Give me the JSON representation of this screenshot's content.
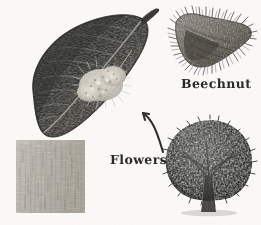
{
  "plate": {
    "kind": "botanical-illustration",
    "subject": "Beech (Fagus) plate",
    "background_color": "#fbfaf9",
    "width": 261,
    "height": 225,
    "style": "engraving / halftone monochrome"
  },
  "labels": {
    "beechnut": "Beechnut",
    "flowers": "Flowers"
  },
  "colors": {
    "background": "#fbfaf9",
    "ink_dark": "#2a2a28",
    "leaf_dark": "#3a3a38",
    "leaf_mid": "#55534f",
    "leaf_light": "#7d7b75",
    "flower_pale": "#e8e4da",
    "bark_light": "#cbc7bf",
    "bark_mid": "#a9a49b",
    "husk_mid": "#8d887e",
    "husk_dark": "#4a4743",
    "tree_canopy_dark": "#3f3f3d",
    "tree_canopy_mid": "#6a6a66",
    "trunk": "#4b4844"
  },
  "figures": [
    {
      "id": "leaf",
      "name": "beech-leaf-with-flowers",
      "caption_ref": "Flowers",
      "bbox": [
        22,
        8,
        150,
        140
      ],
      "description": "Large dark ovate beech leaf with pinnate parallel veins, pointed tip and twig at upper right, pale bristly flower catkin cluster on lower right of blade"
    },
    {
      "id": "bark",
      "name": "beech-bark-swatch",
      "bbox": [
        16,
        140,
        69,
        73
      ],
      "description": "Rectangular pale gray bark texture swatch with fine vertical striations"
    },
    {
      "id": "beechnut",
      "name": "beechnut-husk",
      "caption_ref": "Beechnut",
      "bbox": [
        170,
        10,
        88,
        62
      ],
      "description": "Opened spiny beechnut husk covered in radiating bristles, split showing inner nut"
    },
    {
      "id": "tree",
      "name": "beech-tree-habit",
      "bbox": [
        162,
        118,
        96,
        100
      ],
      "description": "Full rounded broad-crowned deciduous beech tree with short stout trunk and ground shadow"
    },
    {
      "id": "arrow",
      "name": "flowers-pointer-arrow",
      "bbox": [
        140,
        110,
        28,
        42
      ],
      "description": "Curved arrow pointing up-left from the Flowers label toward the flower cluster on the leaf"
    }
  ]
}
